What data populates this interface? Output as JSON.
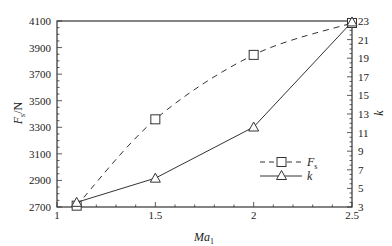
{
  "chart_data": {
    "type": "line",
    "title": "",
    "xlabel": "Ma1",
    "xlabel_main": "Ma",
    "xlabel_sub": "1",
    "ylabel_left": "Fs/N",
    "ylabel_left_main": "F",
    "ylabel_left_sub": "s",
    "ylabel_left_unit": "/N",
    "ylabel_right": "k",
    "xlim": [
      1,
      2.5
    ],
    "ylim_left": [
      2700,
      4100
    ],
    "ylim_right": [
      3,
      23
    ],
    "x_ticks": [
      1,
      1.5,
      2,
      2.5
    ],
    "x_tick_labels": [
      "1",
      "1.5",
      "2",
      "2.5"
    ],
    "y_left_ticks": [
      2700,
      2900,
      3100,
      3300,
      3500,
      3700,
      3900,
      4100
    ],
    "y_left_tick_labels": [
      "2700",
      "2900",
      "3100",
      "3300",
      "3500",
      "3700",
      "3900",
      "4100"
    ],
    "y_right_ticks": [
      3,
      5,
      7,
      9,
      11,
      13,
      15,
      17,
      19,
      21,
      23
    ],
    "y_right_tick_labels": [
      "3",
      "5",
      "7",
      "9",
      "11",
      "13",
      "15",
      "17",
      "19",
      "21",
      "23"
    ],
    "grid": false,
    "legend_position": "lower right",
    "x": [
      1.1,
      1.5,
      2.0,
      2.5
    ],
    "series": [
      {
        "name": "Fs",
        "legend_main": "F",
        "legend_sub": "s",
        "axis": "left",
        "line_style": "dashed",
        "marker": "square",
        "values": [
          2710,
          3360,
          3845,
          4085
        ]
      },
      {
        "name": "k",
        "legend_main": "k",
        "legend_sub": "",
        "axis": "right",
        "line_style": "solid",
        "marker": "triangle",
        "values": [
          3.5,
          6.1,
          11.6,
          22.9
        ]
      }
    ],
    "colors": {
      "line": "#333333",
      "axis": "#333333",
      "background": "#ffffff"
    }
  }
}
